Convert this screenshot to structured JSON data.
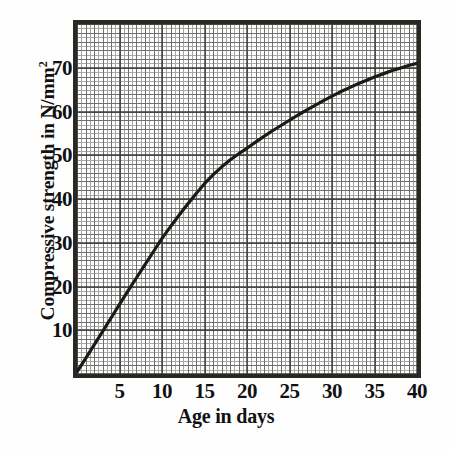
{
  "chart_data": {
    "type": "line",
    "title": "",
    "xlabel": "Age in days",
    "ylabel": "Compressive strength in N/mm2",
    "ylabel_text": "Compressive strength in N/mm",
    "ylabel_superscript": "2",
    "xlim": [
      0,
      40
    ],
    "ylim": [
      0,
      80
    ],
    "xticks": [
      5,
      10,
      15,
      20,
      25,
      30,
      35,
      40
    ],
    "yticks": [
      10,
      20,
      30,
      40,
      50,
      60,
      70
    ],
    "xtick_labels": [
      "5",
      "10",
      "15",
      "20",
      "25",
      "30",
      "35",
      "40"
    ],
    "ytick_labels": [
      "10",
      "20",
      "30",
      "40",
      "50",
      "60",
      "70"
    ],
    "grid": true,
    "grid_style": "graph-paper fine grid, minor every 1 unit, medium every 2 units, major every 5 days / 10 N/mm2",
    "legend": "none",
    "series": [
      {
        "name": "Compressive strength",
        "x": [
          0,
          1,
          2,
          3,
          4,
          5,
          6,
          7,
          8,
          9,
          10,
          11,
          12,
          13,
          14,
          15,
          16,
          17,
          18,
          19,
          20,
          21,
          22,
          23,
          24,
          25,
          26,
          27,
          28,
          29,
          30,
          31,
          32,
          33,
          34,
          35,
          36,
          37,
          38,
          39,
          40
        ],
        "y": [
          0.5,
          3.5,
          6.6,
          9.7,
          12.8,
          15.9,
          19.0,
          22.0,
          25.0,
          28.0,
          31.0,
          33.7,
          36.3,
          38.8,
          41.2,
          43.5,
          45.5,
          47.3,
          48.9,
          50.3,
          51.6,
          53.0,
          54.3,
          55.6,
          56.8,
          58.0,
          59.2,
          60.3,
          61.4,
          62.5,
          63.5,
          64.5,
          65.4,
          66.3,
          67.1,
          67.9,
          68.6,
          69.3,
          69.9,
          70.5,
          71.0
        ]
      }
    ],
    "colors": {
      "curve": "#1c1916",
      "frame": "#2b2723",
      "grid_minor": "#a8a8a8",
      "grid_medium": "#6f6f6f",
      "grid_major": "#3a3a3a",
      "background": "#fdfdfb"
    }
  }
}
